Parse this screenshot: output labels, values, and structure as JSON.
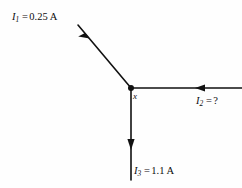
{
  "figure": {
    "background_color": "#fefefe",
    "line_color": "#111111"
  },
  "junction": {
    "node_label": "x",
    "dot_x": 131,
    "dot_y": 88,
    "dot_radius": 3
  },
  "branches": [
    {
      "id": "I1",
      "symbol": "I",
      "subscript": "1",
      "equals": "=",
      "value": "0.25 A",
      "direction": "into-junction",
      "arrow_points": "down-right",
      "line_from": [
        78,
        25
      ],
      "line_to": [
        131,
        88
      ]
    },
    {
      "id": "I2",
      "symbol": "I",
      "subscript": "2",
      "equals": "=",
      "value": "?",
      "direction": "into-junction",
      "arrow_points": "left",
      "line_from": [
        242,
        88
      ],
      "line_to": [
        131,
        88
      ]
    },
    {
      "id": "I3",
      "symbol": "I",
      "subscript": "3",
      "equals": "=",
      "value": "1.1 A",
      "direction": "out-of-junction",
      "arrow_points": "down",
      "line_from": [
        131,
        88
      ],
      "line_to": [
        131,
        180
      ]
    }
  ]
}
